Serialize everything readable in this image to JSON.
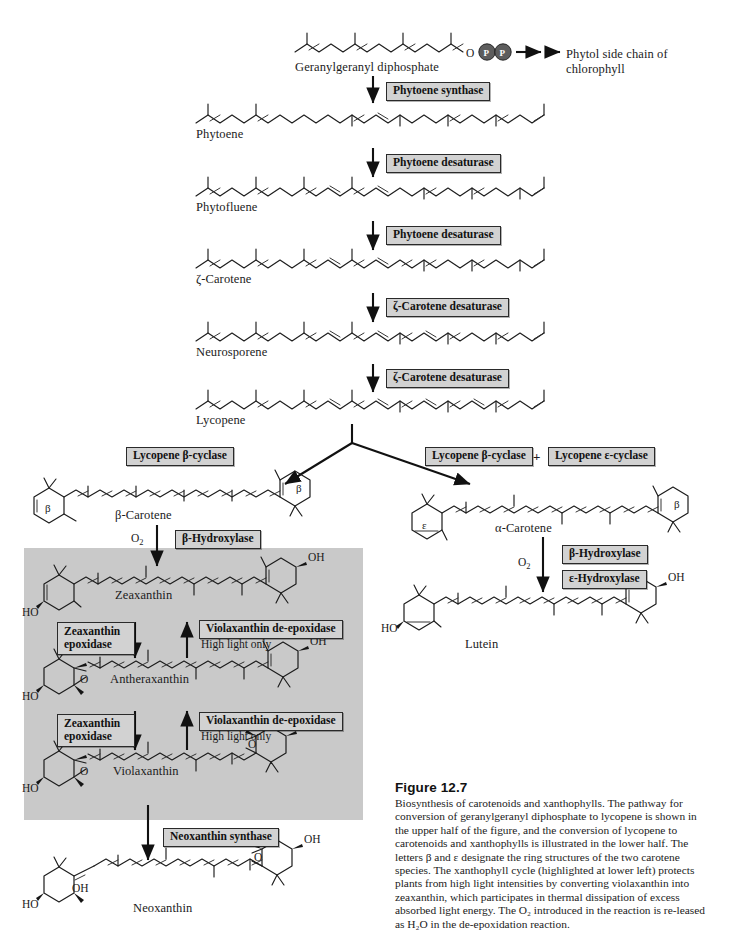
{
  "figure": {
    "number": "Figure 12.7",
    "caption": "Biosynthesis of carotenoids and xanthophylls. The pathway for conversion of geranylgeranyl diphosphate to lycopene is shown in the upper half of the figure, and the conversion of lycopene to carotenoids and xanthophylls is illustrated in the lower half. The letters β and ε designate the ring structures of the two carotene species. The xanthophyll cycle (highlighted at lower left) protects plants from high light intensities by converting violaxanthin into zeaxanthin, which participates in thermal dissipation of excess absorbed light energy. The O₂ introduced in the reaction is re-leased as H₂O in the de-epoxidation reaction."
  },
  "molecules": {
    "ggpp": "Geranylgeranyl diphosphate",
    "phytoene": "Phytoene",
    "phytofluene": "Phytofluene",
    "zeta_carotene": "ζ-Carotene",
    "neurosporene": "Neurosporene",
    "lycopene": "Lycopene",
    "beta_carotene": "β-Carotene",
    "alpha_carotene": "α-Carotene",
    "zeaxanthin": "Zeaxanthin",
    "antheraxanthin": "Antheraxanthin",
    "violaxanthin": "Violaxanthin",
    "neoxanthin": "Neoxanthin",
    "lutein": "Lutein"
  },
  "enzymes": {
    "phytoene_synthase": "Phytoene synthase",
    "phytoene_desaturase_1": "Phytoene desaturase",
    "phytoene_desaturase_2": "Phytoene desaturase",
    "zeta_carotene_desaturase_1": "ζ-Carotene desaturase",
    "zeta_carotene_desaturase_2": "ζ-Carotene desaturase",
    "lycopene_beta_cyclase_left": "Lycopene β-cyclase",
    "lycopene_beta_cyclase_right": "Lycopene β-cyclase",
    "lycopene_epsilon_cyclase": "Lycopene ε-cyclase",
    "cyclase_plus": "+",
    "beta_hydroxylase_left": "β-Hydroxylase",
    "beta_hydroxylase_right": "β-Hydroxylase",
    "epsilon_hydroxylase": "ε-Hydroxylase",
    "zeaxanthin_epoxidase_1": "Zeaxanthin epoxidase",
    "zeaxanthin_epoxidase_2": "Zeaxanthin epoxidase",
    "violaxanthin_de_epoxidase_1": "Violaxanthin de-epoxidase",
    "violaxanthin_de_epoxidase_2": "Violaxanthin de-epoxidase",
    "neoxanthin_synthase": "Neoxanthin synthase"
  },
  "notes": {
    "high_light_1": "High light only",
    "high_light_2": "High light only",
    "o2_left": "O",
    "o2_left_sub": "2",
    "o2_right": "O",
    "o2_right_sub": "2"
  },
  "products": {
    "phytol_line1": "Phytol side chain of",
    "phytol_line2": "chlorophyll"
  },
  "atoms": {
    "o_link": "O",
    "p_left": "P",
    "p_right": "P",
    "ho": "HO",
    "oh": "OH",
    "o_epoxide": "O",
    "beta_ring": "β",
    "epsilon_ring": "ε"
  },
  "colors": {
    "enzyme_box_fill": "#d2d2d2",
    "panel_fill": "#c9c9c9",
    "ink": "#1b1b1b",
    "page": "#ffffff"
  }
}
